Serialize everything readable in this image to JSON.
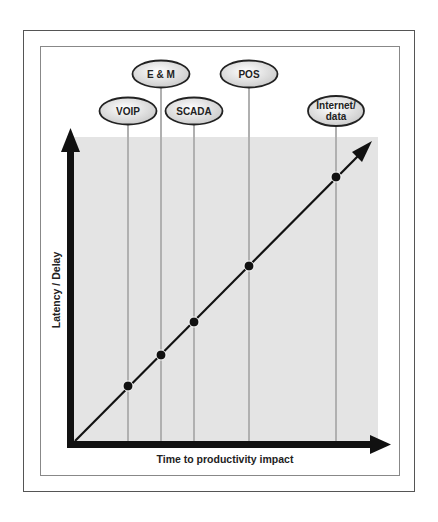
{
  "diagram": {
    "x_axis_label": "Time to productivity impact",
    "y_axis_label": "Latency / Delay",
    "colors": {
      "plot_background": "#e4e4e4",
      "axis": "#111111",
      "guide_line": "#b0b0b0",
      "ellipse_fill": "#e0e0e0",
      "ellipse_border": "#222222",
      "point": "#111111"
    },
    "nodes": [
      {
        "id": "voip",
        "label": "VOIP",
        "cx": 128,
        "cy": 111,
        "point_y": 386
      },
      {
        "id": "em",
        "label": "E & M",
        "cx": 161,
        "cy": 74,
        "point_y": 355
      },
      {
        "id": "scada",
        "label": "SCADA",
        "cx": 194,
        "cy": 111,
        "point_y": 322
      },
      {
        "id": "pos",
        "label": "POS",
        "cx": 249,
        "cy": 74,
        "point_y": 266
      },
      {
        "id": "internet",
        "label": "Internet/\ndata",
        "cx": 336,
        "cy": 111,
        "point_y": 177
      }
    ]
  }
}
